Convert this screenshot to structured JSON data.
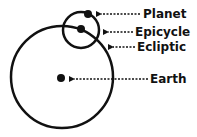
{
  "diagram": {
    "type": "epicycle-model",
    "colors": {
      "stroke": "#111111",
      "background": "#ffffff"
    },
    "deferent": {
      "cx": 62,
      "cy": 77,
      "r": 51
    },
    "epicycle_circle": {
      "cx": 81,
      "cy": 30,
      "r": 18
    },
    "points": {
      "earth": {
        "cx": 61,
        "cy": 78,
        "r": 4
      },
      "epicycle_center": {
        "cx": 81,
        "cy": 29,
        "r": 4
      },
      "planet": {
        "cx": 88,
        "cy": 14,
        "r": 4
      }
    },
    "labels": [
      {
        "id": "planet",
        "text": "Planet",
        "x": 143,
        "y": 18,
        "arrow_from": 140,
        "arrow_to": 96,
        "arrow_y": 14
      },
      {
        "id": "epicycle",
        "text": "Epicycle",
        "x": 135,
        "y": 36,
        "arrow_from": 133,
        "arrow_to": 103,
        "arrow_y": 32
      },
      {
        "id": "ecliptic",
        "text": "Ecliptic",
        "x": 137,
        "y": 51,
        "arrow_from": 135,
        "arrow_to": 108,
        "arrow_y": 47
      },
      {
        "id": "earth",
        "text": "Earth",
        "x": 150,
        "y": 83,
        "arrow_from": 148,
        "arrow_to": 69,
        "arrow_y": 79
      }
    ]
  }
}
